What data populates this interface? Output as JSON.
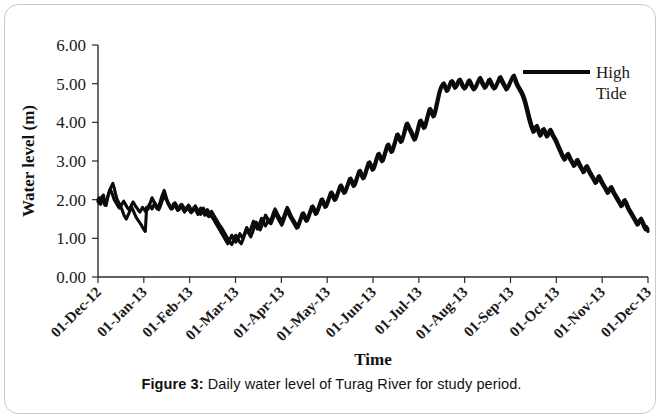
{
  "figure": {
    "caption_label": "Figure 3:",
    "caption_text": " Daily water level of Turag River for study period."
  },
  "chart_data": {
    "type": "line",
    "title": "",
    "xlabel": "Time",
    "ylabel": "Water level (m)",
    "ylim": [
      0.0,
      6.0
    ],
    "ytick_values": [
      0.0,
      1.0,
      2.0,
      3.0,
      4.0,
      5.0,
      6.0
    ],
    "ytick_labels": [
      "0.00",
      "1.00",
      "2.00",
      "3.00",
      "4.00",
      "5.00",
      "6.00"
    ],
    "xtick_labels": [
      "01-Dec-12",
      "01-Jan-13",
      "01-Feb-13",
      "01-Mar-13",
      "01-Apr-13",
      "01-May-13",
      "01-Jun-13",
      "01-Jul-13",
      "01-Aug-13",
      "01-Sep-13",
      "01-Oct-13",
      "01-Nov-13",
      "01-Dec-13"
    ],
    "xlim_labels": [
      "01-Dec-12",
      "01-Dec-13"
    ],
    "grid": false,
    "legend_position": "top-right",
    "series": [
      {
        "name": "High Tide",
        "color": "#0b0b0b",
        "values": [
          1.95,
          2.05,
          1.88,
          2.0,
          2.12,
          1.92,
          1.85,
          2.02,
          2.18,
          2.28,
          2.35,
          2.42,
          2.3,
          2.15,
          2.02,
          1.95,
          1.88,
          1.8,
          1.72,
          1.62,
          1.55,
          1.5,
          1.58,
          1.66,
          1.74,
          1.8,
          1.72,
          1.64,
          1.56,
          1.5,
          1.45,
          1.4,
          1.35,
          1.28,
          1.22,
          1.18,
          1.8,
          1.75,
          1.85,
          1.95,
          2.05,
          1.98,
          1.88,
          1.8,
          1.76,
          1.84,
          1.94,
          2.06,
          2.15,
          2.24,
          2.12,
          2.0,
          1.92,
          1.86,
          1.8,
          1.76,
          1.84,
          1.92,
          1.86,
          1.8,
          1.74,
          1.8,
          1.88,
          1.82,
          1.76,
          1.72,
          1.78,
          1.86,
          1.8,
          1.74,
          1.7,
          1.76,
          1.84,
          1.78,
          1.72,
          1.66,
          1.62,
          1.7,
          1.78,
          1.72,
          1.66,
          1.6,
          1.56,
          1.62,
          1.7,
          1.64,
          1.58,
          1.52,
          1.46,
          1.4,
          1.34,
          1.3,
          1.24,
          1.18,
          1.12,
          1.06,
          1.0,
          0.94,
          0.88,
          0.84,
          0.92,
          1.0,
          1.08,
          1.02,
          0.96,
          0.9,
          0.86,
          0.94,
          1.04,
          1.14,
          1.22,
          1.16,
          1.1,
          1.04,
          1.12,
          1.22,
          1.32,
          1.42,
          1.36,
          1.28,
          1.22,
          1.3,
          1.4,
          1.5,
          1.6,
          1.54,
          1.46,
          1.4,
          1.48,
          1.58,
          1.68,
          1.76,
          1.7,
          1.62,
          1.56,
          1.5,
          1.44,
          1.52,
          1.62,
          1.72,
          1.8,
          1.74,
          1.66,
          1.58,
          1.52,
          1.46,
          1.4,
          1.34,
          1.28,
          1.36,
          1.46,
          1.56,
          1.66,
          1.6,
          1.52,
          1.46,
          1.54,
          1.64,
          1.74,
          1.84,
          1.78,
          1.7,
          1.64,
          1.72,
          1.82,
          1.92,
          2.02,
          1.96,
          1.88,
          1.82,
          1.9,
          2.0,
          2.1,
          2.2,
          2.14,
          2.06,
          2.0,
          2.08,
          2.18,
          2.28,
          2.38,
          2.32,
          2.24,
          2.18,
          2.26,
          2.36,
          2.46,
          2.56,
          2.5,
          2.42,
          2.36,
          2.44,
          2.56,
          2.66,
          2.76,
          2.7,
          2.62,
          2.56,
          2.64,
          2.76,
          2.88,
          2.98,
          2.92,
          2.84,
          2.78,
          2.86,
          2.98,
          3.1,
          3.2,
          3.14,
          3.06,
          3.0,
          3.1,
          3.22,
          3.34,
          3.44,
          3.38,
          3.3,
          3.24,
          3.34,
          3.46,
          3.58,
          3.7,
          3.64,
          3.56,
          3.5,
          3.6,
          3.72,
          3.86,
          3.98,
          3.92,
          3.84,
          3.78,
          3.7,
          3.62,
          3.56,
          3.66,
          3.8,
          3.94,
          4.06,
          4.0,
          3.92,
          3.86,
          3.96,
          4.1,
          4.24,
          4.36,
          4.3,
          4.22,
          4.16,
          4.28,
          4.44,
          4.6,
          4.76,
          4.88,
          4.96,
          5.02,
          4.96,
          4.88,
          4.82,
          4.9,
          5.0,
          5.08,
          5.04,
          4.96,
          4.9,
          4.96,
          5.06,
          5.12,
          5.06,
          4.98,
          4.92,
          4.88,
          4.94,
          5.02,
          5.1,
          5.04,
          4.96,
          4.9,
          4.86,
          4.92,
          5.0,
          5.08,
          5.16,
          5.1,
          5.02,
          4.96,
          4.9,
          4.96,
          5.04,
          5.12,
          5.06,
          4.98,
          4.92,
          4.88,
          4.94,
          5.02,
          5.1,
          5.18,
          5.12,
          5.04,
          4.98,
          4.92,
          4.86,
          4.92,
          5.0,
          5.08,
          5.16,
          5.22,
          5.14,
          5.04,
          4.96,
          4.9,
          4.84,
          4.78,
          4.7,
          4.6,
          4.48,
          4.34,
          4.2,
          4.06,
          3.94,
          3.84,
          3.76,
          3.84,
          3.92,
          3.84,
          3.74,
          3.66,
          3.74,
          3.84,
          3.78,
          3.7,
          3.64,
          3.72,
          3.82,
          3.76,
          3.68,
          3.62,
          3.56,
          3.48,
          3.4,
          3.32,
          3.24,
          3.16,
          3.1,
          3.04,
          3.12,
          3.2,
          3.14,
          3.06,
          3.0,
          2.94,
          2.88,
          2.96,
          3.04,
          2.98,
          2.9,
          2.84,
          2.78,
          2.72,
          2.8,
          2.88,
          2.82,
          2.74,
          2.68,
          2.62,
          2.56,
          2.5,
          2.44,
          2.52,
          2.62,
          2.56,
          2.48,
          2.42,
          2.36,
          2.3,
          2.24,
          2.18,
          2.26,
          2.34,
          2.28,
          2.2,
          2.14,
          2.08,
          2.02,
          1.96,
          1.9,
          1.84,
          1.92,
          2.0,
          1.94,
          1.86,
          1.78,
          1.72,
          1.66,
          1.6,
          1.54,
          1.48,
          1.42,
          1.36,
          1.44,
          1.52,
          1.46,
          1.38,
          1.3,
          1.24,
          1.18
        ]
      },
      {
        "name": "High Tide (second gauge)",
        "color": "#0b0b0b",
        "values": [
          2.0,
          1.9,
          1.98,
          2.08,
          1.96,
          1.86,
          1.94,
          2.06,
          2.16,
          2.26,
          2.2,
          2.1,
          2.0,
          1.94,
          1.88,
          1.82,
          1.78,
          1.84,
          1.9,
          1.96,
          1.9,
          1.84,
          1.78,
          1.74,
          1.8,
          1.88,
          1.94,
          1.88,
          1.82,
          1.78,
          1.72,
          1.68,
          1.74,
          1.8,
          1.76,
          1.7,
          1.72,
          1.8,
          1.88,
          1.82,
          1.76,
          1.84,
          1.92,
          1.86,
          1.8,
          1.74,
          1.82,
          1.92,
          2.02,
          2.12,
          2.04,
          1.96,
          1.88,
          1.82,
          1.76,
          1.82,
          1.9,
          1.84,
          1.78,
          1.72,
          1.78,
          1.86,
          1.8,
          1.74,
          1.68,
          1.74,
          1.82,
          1.76,
          1.7,
          1.66,
          1.72,
          1.8,
          1.74,
          1.68,
          1.62,
          1.7,
          1.78,
          1.72,
          1.66,
          1.6,
          1.66,
          1.74,
          1.68,
          1.62,
          1.56,
          1.52,
          1.46,
          1.4,
          1.34,
          1.28,
          1.22,
          1.16,
          1.1,
          1.04,
          0.98,
          0.92,
          0.86,
          0.92,
          1.0,
          1.08,
          1.02,
          0.96,
          0.9,
          0.96,
          1.04,
          1.12,
          1.06,
          1.0,
          1.08,
          1.18,
          1.28,
          1.22,
          1.16,
          1.24,
          1.34,
          1.44,
          1.38,
          1.3,
          1.24,
          1.32,
          1.42,
          1.52,
          1.46,
          1.38,
          1.32,
          1.4,
          1.5,
          1.44,
          1.38,
          1.46,
          1.56,
          1.66,
          1.6,
          1.52,
          1.46,
          1.4,
          1.34,
          1.42,
          1.52,
          1.62,
          1.7,
          1.64,
          1.56,
          1.5,
          1.44,
          1.38,
          1.32,
          1.26,
          1.34,
          1.44,
          1.54,
          1.64,
          1.58,
          1.5,
          1.44,
          1.52,
          1.62,
          1.72,
          1.82,
          1.76,
          1.68,
          1.62,
          1.7,
          1.8,
          1.9,
          2.0,
          1.94,
          1.86,
          1.8,
          1.88,
          1.98,
          2.08,
          2.18,
          2.12,
          2.04,
          1.98,
          2.06,
          2.16,
          2.26,
          2.36,
          2.3,
          2.22,
          2.16,
          2.24,
          2.34,
          2.44,
          2.54,
          2.48,
          2.4,
          2.34,
          2.42,
          2.54,
          2.64,
          2.74,
          2.68,
          2.6,
          2.54,
          2.62,
          2.74,
          2.86,
          2.96,
          2.9,
          2.82,
          2.76,
          2.84,
          2.96,
          3.08,
          3.18,
          3.12,
          3.04,
          2.98,
          3.08,
          3.2,
          3.32,
          3.42,
          3.36,
          3.28,
          3.22,
          3.32,
          3.44,
          3.56,
          3.68,
          3.62,
          3.54,
          3.48,
          3.58,
          3.7,
          3.84,
          3.96,
          3.9,
          3.82,
          3.76,
          3.68,
          3.6,
          3.54,
          3.64,
          3.78,
          3.92,
          4.04,
          3.98,
          3.9,
          3.84,
          3.94,
          4.08,
          4.22,
          4.34,
          4.28,
          4.2,
          4.14,
          4.26,
          4.42,
          4.58,
          4.74,
          4.86,
          4.94,
          5.0,
          4.94,
          4.86,
          4.8,
          4.88,
          4.98,
          5.06,
          5.02,
          4.94,
          4.88,
          4.94,
          5.04,
          5.1,
          5.04,
          4.96,
          4.9,
          4.86,
          4.92,
          5.0,
          5.08,
          5.02,
          4.94,
          4.88,
          4.84,
          4.9,
          4.98,
          5.06,
          5.14,
          5.08,
          5.0,
          4.94,
          4.88,
          4.94,
          5.02,
          5.1,
          5.04,
          4.96,
          4.9,
          4.86,
          4.92,
          5.0,
          5.08,
          5.16,
          5.1,
          5.02,
          4.96,
          4.9,
          4.84,
          4.9,
          4.98,
          5.06,
          5.14,
          5.2,
          5.12,
          5.02,
          4.94,
          4.88,
          4.82,
          4.76,
          4.68,
          4.58,
          4.46,
          4.32,
          4.18,
          4.04,
          3.92,
          3.82,
          3.74,
          3.82,
          3.9,
          3.82,
          3.72,
          3.64,
          3.72,
          3.82,
          3.76,
          3.68,
          3.62,
          3.7,
          3.8,
          3.74,
          3.66,
          3.6,
          3.54,
          3.46,
          3.38,
          3.3,
          3.22,
          3.14,
          3.08,
          3.02,
          3.1,
          3.18,
          3.12,
          3.04,
          2.98,
          2.92,
          2.86,
          2.94,
          3.02,
          2.96,
          2.88,
          2.82,
          2.76,
          2.7,
          2.78,
          2.86,
          2.8,
          2.72,
          2.66,
          2.6,
          2.54,
          2.48,
          2.42,
          2.5,
          2.6,
          2.54,
          2.46,
          2.4,
          2.34,
          2.28,
          2.22,
          2.16,
          2.24,
          2.32,
          2.26,
          2.18,
          2.12,
          2.06,
          2.0,
          1.94,
          1.88,
          1.82,
          1.9,
          1.98,
          1.92,
          1.84,
          1.76,
          1.7,
          1.64,
          1.58,
          1.52,
          1.46,
          1.4,
          1.34,
          1.42,
          1.5,
          1.44,
          1.36,
          1.28,
          1.22,
          1.3,
          1.24
        ]
      }
    ],
    "legend": [
      {
        "label_line1": "High",
        "label_line2": "Tide",
        "color": "#0b0b0b"
      }
    ]
  }
}
